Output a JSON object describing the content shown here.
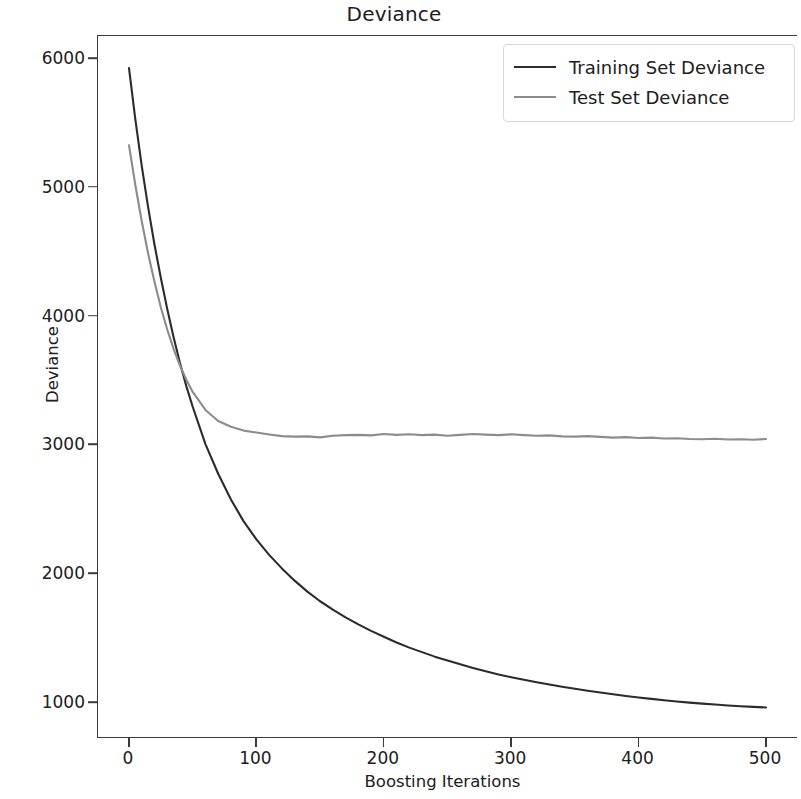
{
  "chart_data": {
    "type": "line",
    "title": "Deviance",
    "xlabel": "Boosting Iterations",
    "ylabel": "Deviance",
    "xlim": [
      0,
      500
    ],
    "ylim": [
      790,
      6300
    ],
    "xticks": [
      0,
      100,
      200,
      300,
      400,
      500
    ],
    "yticks": [
      1000,
      2000,
      3000,
      4000,
      5000,
      6000
    ],
    "xticklabels": [
      "0",
      "100",
      "200",
      "300",
      "400",
      "500"
    ],
    "yticklabels": [
      "1000",
      "2000",
      "3000",
      "4000",
      "5000",
      "6000"
    ],
    "grid": false,
    "legend_position": "upper right",
    "series": [
      {
        "name": "Training Set Deviance",
        "color": "#2b2b2b",
        "x": [
          0,
          5,
          10,
          15,
          20,
          25,
          30,
          35,
          40,
          45,
          50,
          60,
          70,
          80,
          90,
          100,
          110,
          120,
          130,
          140,
          150,
          160,
          170,
          180,
          190,
          200,
          210,
          220,
          230,
          240,
          250,
          260,
          270,
          280,
          290,
          300,
          310,
          320,
          330,
          340,
          350,
          360,
          370,
          380,
          390,
          400,
          410,
          420,
          430,
          440,
          450,
          460,
          470,
          480,
          490,
          500
        ],
        "values": [
          5930,
          5530,
          5170,
          4850,
          4560,
          4300,
          4060,
          3840,
          3640,
          3460,
          3300,
          3010,
          2780,
          2580,
          2410,
          2270,
          2150,
          2045,
          1950,
          1865,
          1790,
          1725,
          1665,
          1610,
          1560,
          1515,
          1470,
          1430,
          1395,
          1360,
          1330,
          1300,
          1272,
          1246,
          1222,
          1200,
          1180,
          1161,
          1143,
          1126,
          1110,
          1095,
          1081,
          1068,
          1055,
          1043,
          1032,
          1022,
          1012,
          1003,
          995,
          988,
          981,
          975,
          970,
          965
        ]
      },
      {
        "name": "Test Set Deviance",
        "color": "#8c8c8c",
        "x": [
          0,
          5,
          10,
          15,
          20,
          25,
          30,
          35,
          40,
          45,
          50,
          60,
          70,
          80,
          90,
          100,
          110,
          120,
          130,
          140,
          150,
          160,
          170,
          180,
          190,
          200,
          210,
          220,
          230,
          240,
          250,
          260,
          270,
          280,
          290,
          300,
          310,
          320,
          330,
          340,
          350,
          360,
          370,
          380,
          390,
          400,
          410,
          420,
          430,
          440,
          450,
          460,
          470,
          480,
          490,
          500
        ],
        "values": [
          5330,
          5020,
          4740,
          4490,
          4270,
          4070,
          3900,
          3750,
          3620,
          3510,
          3415,
          3275,
          3190,
          3145,
          3115,
          3100,
          3085,
          3072,
          3068,
          3070,
          3062,
          3075,
          3080,
          3082,
          3078,
          3088,
          3082,
          3086,
          3080,
          3084,
          3075,
          3082,
          3088,
          3084,
          3080,
          3086,
          3080,
          3075,
          3078,
          3070,
          3068,
          3072,
          3066,
          3060,
          3064,
          3058,
          3060,
          3054,
          3056,
          3050,
          3048,
          3052,
          3046,
          3048,
          3044,
          3050
        ]
      }
    ]
  }
}
